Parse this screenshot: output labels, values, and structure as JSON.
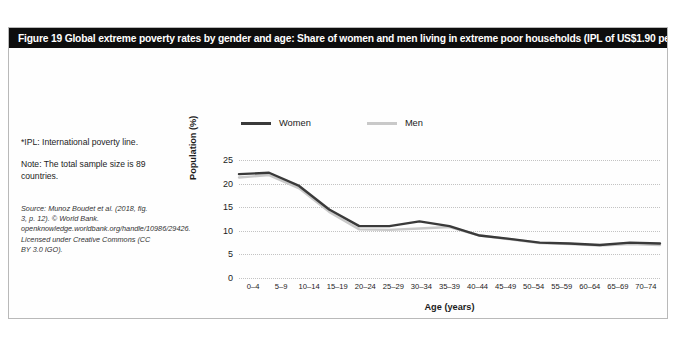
{
  "figure": {
    "title": "Figure 19  Global extreme poverty rates by gender and age: Share of women and men living in extreme poor households (IPL of US$1.90 per day)*"
  },
  "notes": {
    "ipl_note": "*IPL: International poverty line.",
    "sample_note": "Note: The total sample size is 89 countries.",
    "source": "Source: Munoz Boudet et al. (2018, fig. 3, p. 12). © World Bank. openknowledge.worldbank.org/handle/10986/29426. Licensed under Creative Commons (CC BY 3.0 IGO)."
  },
  "colors": {
    "women": "#3a3a3a",
    "men": "#c9c9c9",
    "grid": "#c3c3c3",
    "title_bar": "#0d0d0d",
    "title_text": "#ffffff"
  },
  "chart_data": {
    "type": "line",
    "title": "Global extreme poverty rates by gender and age",
    "xlabel": "Age (years)",
    "ylabel": "Population (%)",
    "ylim": [
      0,
      25
    ],
    "yticks": [
      0,
      5,
      10,
      15,
      20,
      25
    ],
    "grid": true,
    "legend_position": "top",
    "categories": [
      "0–4",
      "5–9",
      "10–14",
      "15–19",
      "20–24",
      "25–29",
      "30–34",
      "35–39",
      "40–44",
      "45–49",
      "50–54",
      "55–59",
      "60–64",
      "65–69",
      "70–74"
    ],
    "series": [
      {
        "name": "Women",
        "color": "#3a3a3a",
        "values": [
          22.0,
          22.3,
          19.5,
          14.5,
          11.0,
          11.0,
          12.0,
          11.0,
          9.0,
          8.3,
          7.5,
          7.3,
          7.0,
          7.5,
          7.3
        ]
      },
      {
        "name": "Men",
        "color": "#c9c9c9",
        "values": [
          21.3,
          21.8,
          19.0,
          14.0,
          10.3,
          10.2,
          10.5,
          10.8,
          9.0,
          8.2,
          7.4,
          7.2,
          6.9,
          7.2,
          7.0
        ]
      }
    ]
  }
}
